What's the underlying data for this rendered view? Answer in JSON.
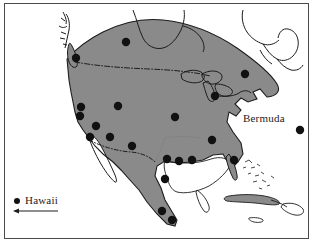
{
  "figure": {
    "name": "north-america-distribution-map",
    "background_color": "#ffffff",
    "frame_color": "#4a4a4a",
    "land_fill_color": "#8a8a8a",
    "outline_color": "#1c1c1c",
    "marker_color": "#111111"
  },
  "labels": {
    "bermuda": "Bermuda",
    "hawaii": "Hawaii"
  },
  "legend": {
    "hawaii_marker_name": "hawaii-legend-dot",
    "hawaii_arrow_name": "hawaii-offscreen-arrow"
  },
  "markers": [
    {
      "name": "marker-vancouver-island",
      "x": 71,
      "y": 54,
      "r": 4.2
    },
    {
      "name": "marker-central-canada",
      "x": 121,
      "y": 38,
      "r": 4.2
    },
    {
      "name": "marker-pacific-northwest",
      "x": 76,
      "y": 103,
      "r": 4.2
    },
    {
      "name": "marker-northern-california",
      "x": 75,
      "y": 112,
      "r": 4.2
    },
    {
      "name": "marker-northern-rockies",
      "x": 113,
      "y": 102,
      "r": 4.2
    },
    {
      "name": "marker-central-california",
      "x": 91,
      "y": 122,
      "r": 4.2
    },
    {
      "name": "marker-southern-california",
      "x": 85,
      "y": 133,
      "r": 4.2
    },
    {
      "name": "marker-southwest",
      "x": 105,
      "y": 133,
      "r": 4.2
    },
    {
      "name": "marker-arizona",
      "x": 127,
      "y": 142,
      "r": 4.2
    },
    {
      "name": "marker-great-plains",
      "x": 170,
      "y": 113,
      "r": 4.2
    },
    {
      "name": "marker-great-lakes",
      "x": 210,
      "y": 92,
      "r": 4.2
    },
    {
      "name": "marker-northeast",
      "x": 240,
      "y": 70,
      "r": 4.2
    },
    {
      "name": "marker-southeast-inland",
      "x": 207,
      "y": 136,
      "r": 4.2
    },
    {
      "name": "marker-gulf-texas",
      "x": 162,
      "y": 155,
      "r": 4.2
    },
    {
      "name": "marker-gulf-louisiana",
      "x": 174,
      "y": 157,
      "r": 4.2
    },
    {
      "name": "marker-gulf-coast-east",
      "x": 187,
      "y": 156,
      "r": 4.2
    },
    {
      "name": "marker-florida",
      "x": 229,
      "y": 156,
      "r": 4.2
    },
    {
      "name": "marker-northern-mexico",
      "x": 160,
      "y": 175,
      "r": 4.2
    },
    {
      "name": "marker-central-mexico",
      "x": 157,
      "y": 207,
      "r": 4.2
    },
    {
      "name": "marker-southern-mexico",
      "x": 167,
      "y": 216,
      "r": 4.2
    },
    {
      "name": "marker-bermuda",
      "x": 295,
      "y": 126,
      "r": 4.2
    }
  ],
  "map_features": {
    "shaded_range_name": "shaded-distribution-range",
    "coastline_name": "coastline-outline",
    "us_canada_border_name": "us-canada-border-dashed",
    "us_mexico_border_name": "us-mexico-border-dashed",
    "great_lakes_name": "great-lakes-outline",
    "hudson_bay_name": "hudson-bay-outline",
    "cuba_name": "cuba-island",
    "bahamas_name": "bahamas-islands",
    "baja_name": "baja-california-peninsula"
  }
}
